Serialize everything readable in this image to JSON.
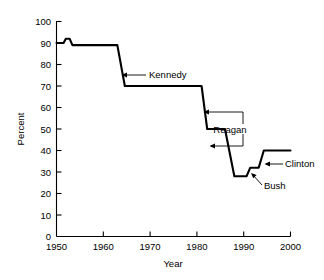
{
  "chart_data": {
    "type": "line",
    "title": "",
    "xlabel": "Year",
    "ylabel": "Percent",
    "xlim": [
      1950,
      2000
    ],
    "ylim": [
      0,
      100
    ],
    "grid": false,
    "legend": "none",
    "xticks": [
      1950,
      1960,
      1970,
      1980,
      1990,
      2000
    ],
    "yticks": [
      0,
      10,
      20,
      30,
      40,
      50,
      60,
      70,
      80,
      90,
      100
    ],
    "series": [
      {
        "name": "Percent",
        "x": [
          1950,
          1951.5,
          1952,
          1952.8,
          1953.4,
          1963,
          1964.6,
          1981,
          1982.2,
          1986,
          1988,
          1990.6,
          1991.4,
          1992.4,
          1993.2,
          1994.3,
          2000
        ],
        "y": [
          90,
          90,
          92,
          92,
          89,
          89,
          70,
          70,
          50,
          50,
          28,
          28,
          32,
          32,
          32,
          40,
          40
        ]
      }
    ],
    "annotations": [
      {
        "label": "Kennedy",
        "x": 1964.2,
        "y": 75
      },
      {
        "label": "Reagan",
        "x": 1988.5,
        "y": 50
      },
      {
        "label": "Bush",
        "x": 1993.5,
        "y": 26
      },
      {
        "label": "Clinton",
        "x": 1996.5,
        "y": 37
      }
    ]
  },
  "axes": {
    "x_title": "Year",
    "y_title": "Percent",
    "x_tick_labels": [
      "1950",
      "1960",
      "1970",
      "1980",
      "1990",
      "2000"
    ],
    "y_tick_labels": [
      "0",
      "10",
      "20",
      "30",
      "40",
      "50",
      "60",
      "70",
      "80",
      "90",
      "100"
    ]
  },
  "annotation_labels": {
    "kennedy": "Kennedy",
    "reagan": "Reagan",
    "bush": "Bush",
    "clinton": "Clinton"
  },
  "colors": {
    "background": "#ffffff",
    "ink": "#000000",
    "data_line": "#000000"
  }
}
